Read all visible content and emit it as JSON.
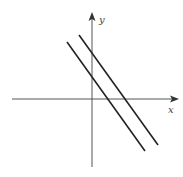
{
  "diagram": {
    "type": "coordinate-plane",
    "axes": {
      "x_label": "x",
      "y_label": "y",
      "color": "#555555"
    },
    "lines": [
      {
        "name": "line-1",
        "from": [
          67,
          42
        ],
        "to": [
          145,
          151
        ],
        "color": "#222222"
      },
      {
        "name": "line-2",
        "from": [
          79,
          35
        ],
        "to": [
          158,
          145
        ],
        "color": "#222222"
      }
    ]
  }
}
